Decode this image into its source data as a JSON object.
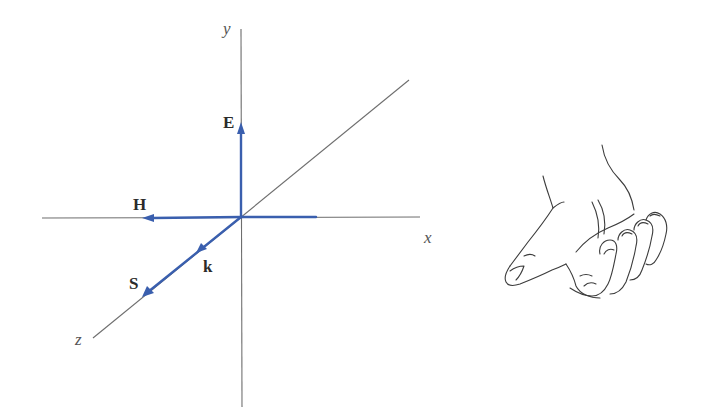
{
  "figure": {
    "axes": {
      "x_label": "x",
      "y_label": "y",
      "z_label": "z"
    },
    "vectors": {
      "E": {
        "label": "E",
        "direction": "+y"
      },
      "H": {
        "label": "H",
        "direction": "-x"
      },
      "k": {
        "label": "k",
        "direction": "+z"
      },
      "S": {
        "label": "S",
        "direction": "+z"
      }
    },
    "colors": {
      "vector": "#3a5fae",
      "axis": "#6e6e6e",
      "label": "#2b2b2b"
    },
    "illustration": "right-hand-rule"
  }
}
